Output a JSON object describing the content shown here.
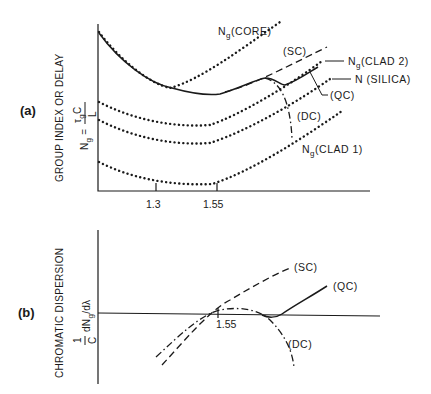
{
  "panel_a": {
    "panel_label": "(a)",
    "y_axis_label_line1": "GROUP INDEX OR DELAY",
    "y_axis_formula_lhs": "N",
    "y_axis_formula_lhs_sub": "g",
    "y_axis_formula_eq": "=",
    "y_axis_formula_num": "τ",
    "y_axis_formula_num_sub": "g",
    "y_axis_formula_num_c": "C",
    "y_axis_formula_den": "L",
    "x_ticks": [
      "1.3",
      "1.55"
    ],
    "curves": [
      {
        "id": "core",
        "label": "N",
        "sub": "g",
        "suffix": "(CORE)",
        "style": "dotted"
      },
      {
        "id": "sc",
        "label": "(SC)",
        "style": "dashed"
      },
      {
        "id": "clad2",
        "label": "N",
        "sub": "g",
        "suffix": "(CLAD 2)",
        "style": "dotted"
      },
      {
        "id": "silica",
        "label": "N  (SILICA)",
        "style": "dotted"
      },
      {
        "id": "qc",
        "label": "(QC)",
        "style": "solid"
      },
      {
        "id": "dc",
        "label": "(DC)",
        "style": "dash-dot"
      },
      {
        "id": "clad1",
        "label": "N",
        "sub": "g",
        "suffix": "(CLAD 1)",
        "style": "dotted"
      }
    ]
  },
  "panel_b": {
    "panel_label": "(b)",
    "y_axis_label_line1": "CHROMATIC DISPERSION",
    "y_axis_formula_frac_num": "1",
    "y_axis_formula_frac_den": "C",
    "y_axis_formula_rest": "dN",
    "y_axis_formula_rest_sub": "g",
    "y_axis_formula_tail": "/dλ",
    "x_tick": "1.55",
    "curves": [
      {
        "id": "sc",
        "label": "(SC)",
        "style": "dashed"
      },
      {
        "id": "qc",
        "label": "(QC)",
        "style": "solid"
      },
      {
        "id": "dc",
        "label": "(DC)",
        "style": "dash-dot"
      }
    ]
  }
}
